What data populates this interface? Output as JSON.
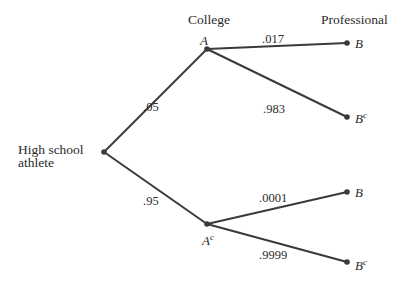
{
  "diagram": {
    "type": "probability-tree",
    "columns": {
      "college_header": "College",
      "professional_header": "Professional"
    },
    "root": {
      "label_line1": "High school",
      "label_line2": "athlete"
    },
    "level1": [
      {
        "event": "A",
        "sup": "",
        "probability": ".05"
      },
      {
        "event": "A",
        "sup": "c",
        "probability": ".95"
      }
    ],
    "level2": [
      {
        "parent": "A",
        "event": "B",
        "sup": "",
        "probability": ".017"
      },
      {
        "parent": "A",
        "event": "B",
        "sup": "c",
        "probability": ".983"
      },
      {
        "parent": "Ac",
        "event": "B",
        "sup": "",
        "probability": ".0001"
      },
      {
        "parent": "Ac",
        "event": "B",
        "sup": "c",
        "probability": ".9999"
      }
    ],
    "colors": {
      "line": "#3a3a3a",
      "text": "#2b2b2b",
      "background": "#ffffff"
    }
  }
}
